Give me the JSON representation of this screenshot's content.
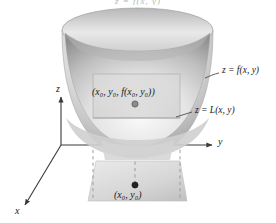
{
  "figure": {
    "title_cropped": "z = f(x, y)",
    "surface_label": "z = f(x, y)",
    "tangent_plane_label": "z = L(x, y)",
    "tangent_point_label": "(x₀, y₀, f(x₀, y₀))",
    "base_point_label": "(x₀, y₀)",
    "axes": {
      "z_label": "z",
      "y_label": "y",
      "x_label": "x"
    },
    "colors": {
      "surface_light": "#f2f2f2",
      "surface_mid": "#c9c9c9",
      "surface_dark": "#9a9a9a",
      "plane_fill": "#d8d8d8",
      "base_fill": "#dedede",
      "axis_stroke": "#3a3a3a",
      "dash_stroke": "#9b9b9b",
      "text": "#1a1a1a"
    }
  }
}
